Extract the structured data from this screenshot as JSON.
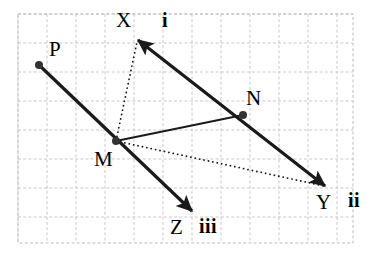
{
  "figure": {
    "type": "vector-geometry-diagram",
    "width": 373,
    "height": 254,
    "background_color": "#ffffff",
    "grid": {
      "visible": true,
      "style": "dashed",
      "color": "#c9c9c9",
      "cell_size_px": 29,
      "x_start": 18,
      "y_start": 14,
      "x_end": 353,
      "y_end": 243,
      "columns": 12,
      "rows": 8,
      "border_color": "#bdbdbd"
    },
    "stroke_color": "#1a1a1a",
    "points": [
      {
        "id": "P",
        "label": "P",
        "x": 39,
        "y": 65,
        "marker": "filled-dot",
        "label_dx": 10,
        "label_dy": -26
      },
      {
        "id": "M",
        "label": "M",
        "x": 116,
        "y": 141,
        "marker": "filled-dot",
        "label_dx": -22,
        "label_dy": 8
      },
      {
        "id": "N",
        "label": "N",
        "x": 243,
        "y": 115,
        "marker": "filled-dot",
        "label_dx": 3,
        "label_dy": -27
      },
      {
        "id": "X",
        "label": "X",
        "x": 138,
        "y": 40,
        "marker": "arrow-tip",
        "label_dx": -22,
        "label_dy": -30
      },
      {
        "id": "Y",
        "label": "Y",
        "x": 325,
        "y": 186,
        "marker": "arrow-tip",
        "label_dx": -9,
        "label_dy": 6
      },
      {
        "id": "Z",
        "label": "Z",
        "x": 192,
        "y": 211,
        "marker": "arrow-tip",
        "label_dx": -22,
        "label_dy": 6
      }
    ],
    "roman_labels": [
      {
        "id": "i",
        "text": "i",
        "x": 162,
        "y": 10,
        "refers_to": "X"
      },
      {
        "id": "ii",
        "text": "ii",
        "x": 348,
        "y": 190,
        "refers_to": "Y"
      },
      {
        "id": "iii",
        "text": "iii",
        "x": 199,
        "y": 216,
        "refers_to": "Z"
      }
    ],
    "segments": [
      {
        "id": "P-M-Z",
        "label": "ray from P through M to Z",
        "from": "P",
        "to": "Z",
        "style": "solid",
        "width": 3.2,
        "arrow_start": false,
        "arrow_end": true,
        "points": [
          [
            39,
            65
          ],
          [
            192,
            211
          ]
        ]
      },
      {
        "id": "X-N-Y",
        "label": "double-headed arrow from X through N to Y",
        "from": "X",
        "to": "Y",
        "style": "solid",
        "width": 3.2,
        "arrow_start": true,
        "arrow_end": true,
        "points": [
          [
            138,
            40
          ],
          [
            325,
            186
          ]
        ]
      },
      {
        "id": "M-N",
        "label": "segment from M to N",
        "from": "M",
        "to": "N",
        "style": "solid",
        "width": 1.8,
        "arrow_start": false,
        "arrow_end": false,
        "points": [
          [
            116,
            141
          ],
          [
            243,
            115
          ]
        ]
      },
      {
        "id": "M-X",
        "label": "dotted segment from M to X",
        "from": "M",
        "to": "X",
        "style": "dotted",
        "width": 1.8,
        "arrow_start": false,
        "arrow_end": false,
        "points": [
          [
            116,
            141
          ],
          [
            137,
            42
          ]
        ]
      },
      {
        "id": "M-Y",
        "label": "dotted segment from M to Y",
        "from": "M",
        "to": "Y",
        "style": "dotted",
        "width": 1.8,
        "arrow_start": false,
        "arrow_end": false,
        "points": [
          [
            116,
            141
          ],
          [
            324,
            186
          ]
        ]
      }
    ]
  }
}
